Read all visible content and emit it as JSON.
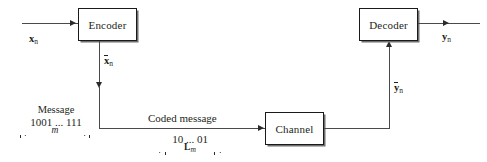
{
  "diagram": {
    "blocks": [
      {
        "id": "encoder",
        "label": "Encoder"
      },
      {
        "id": "channel",
        "label": "Channel"
      },
      {
        "id": "decoder",
        "label": "Decoder"
      }
    ],
    "signals": {
      "input": {
        "base": "x",
        "subscript": "n",
        "overbar": false,
        "bold": true
      },
      "encoded": {
        "base": "x",
        "subscript": "n",
        "overbar": true,
        "bold": true
      },
      "received": {
        "base": "y",
        "subscript": "n",
        "overbar": true,
        "bold": true
      },
      "output": {
        "base": "y",
        "subscript": "n",
        "overbar": false,
        "bold": true
      }
    },
    "message_block": {
      "caption": "Message",
      "bits": "1001 ... 111",
      "length_label": "m"
    },
    "coded_block": {
      "caption": "Coded message",
      "bits": "10 ... 01",
      "length_label": "L",
      "length_subscript": "m"
    },
    "colors": {
      "stroke": "#1a1a1a",
      "line": "#4a4a4a",
      "shadow": "#6f6f6f",
      "text": "#231f20",
      "background": "#ffffff"
    }
  }
}
